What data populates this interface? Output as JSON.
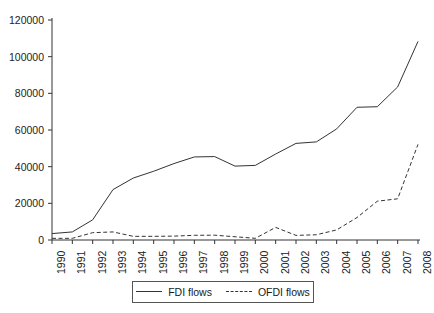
{
  "chart_data": {
    "type": "line",
    "title": "",
    "xlabel": "",
    "ylabel": "",
    "grid": false,
    "legend_position": "bottom",
    "x": [
      1990,
      1991,
      1992,
      1993,
      1994,
      1995,
      1996,
      1997,
      1998,
      1999,
      2000,
      2001,
      2002,
      2003,
      2004,
      2005,
      2006,
      2007,
      2008
    ],
    "categories": [
      "1990",
      "1991",
      "1992",
      "1993",
      "1994",
      "1995",
      "1996",
      "1997",
      "1998",
      "1999",
      "2000",
      "2001",
      "2002",
      "2003",
      "2004",
      "2005",
      "2006",
      "2007",
      "2008"
    ],
    "xlim": [
      1990,
      2008
    ],
    "ylim": [
      0,
      120000
    ],
    "yticks": [
      0,
      20000,
      40000,
      60000,
      80000,
      100000,
      120000
    ],
    "ytick_labels": [
      "0",
      "20000",
      "40000",
      "60000",
      "80000",
      "100000",
      "120000"
    ],
    "series": [
      {
        "name": "FDI flows",
        "style": "solid",
        "color": "#333333",
        "values": [
          3500,
          4400,
          11000,
          27500,
          33800,
          37500,
          41700,
          45300,
          45500,
          40300,
          40700,
          46900,
          52700,
          53500,
          60600,
          72400,
          72700,
          83500,
          108300
        ]
      },
      {
        "name": "OFDI flows",
        "style": "dashed",
        "color": "#333333",
        "values": [
          900,
          913,
          4000,
          4400,
          2000,
          2000,
          2114,
          2563,
          2634,
          1774,
          916,
          6885,
          2518,
          2855,
          5498,
          12261,
          21160,
          22469,
          52150
        ]
      }
    ]
  },
  "legend": {
    "items": [
      {
        "label": "FDI flows",
        "style": "solid"
      },
      {
        "label": "OFDI flows",
        "style": "dashed"
      }
    ]
  },
  "axes": {
    "y_axis_name": "value-axis",
    "x_axis_name": "year-axis"
  }
}
